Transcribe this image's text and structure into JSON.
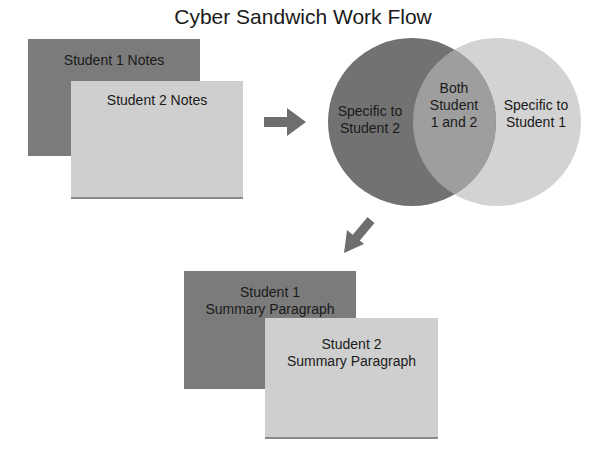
{
  "title": "Cyber Sandwich Work Flow",
  "notes": {
    "student1": "Student 1 Notes",
    "student2": "Student 2 Notes"
  },
  "venn": {
    "left": [
      "Specific to",
      "Student 2"
    ],
    "overlap": [
      "Both",
      "Student",
      "1 and 2"
    ],
    "right": [
      "Specific to",
      "Student 1"
    ]
  },
  "summaries": {
    "student1": [
      "Student 1",
      "Summary Paragraph"
    ],
    "student2": [
      "Student 2",
      "Summary Paragraph"
    ]
  },
  "colors": {
    "dark": "#7b7b7b",
    "light": "#cfcfcf",
    "arrow": "#6e6e6e",
    "overlap": "#9d9d9d"
  }
}
